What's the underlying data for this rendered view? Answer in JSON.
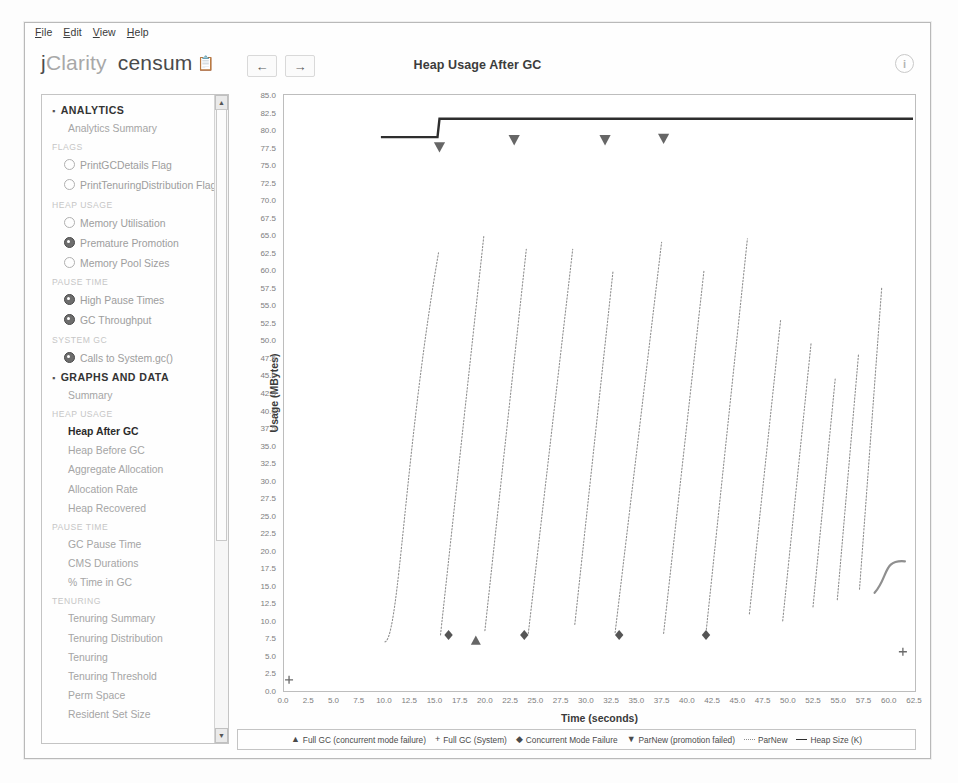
{
  "window": {
    "menubar": [
      {
        "label": "File",
        "mnemonic": "F"
      },
      {
        "label": "Edit",
        "mnemonic": "E"
      },
      {
        "label": "View",
        "mnemonic": "V"
      },
      {
        "label": "Help",
        "mnemonic": "H"
      }
    ]
  },
  "brand": {
    "j": "j",
    "clarity": "Clarity",
    "product": "censum",
    "trademark_icon": "clipboard-icon"
  },
  "toolbar": {
    "back_label": "←",
    "forward_label": "→",
    "title": "Heap Usage After GC",
    "help_label": "i",
    "help_icon": "info-icon"
  },
  "sidebar": {
    "sections": [
      {
        "type": "group",
        "label": "ANALYTICS",
        "rows": [
          {
            "type": "plain",
            "label": "Analytics Summary"
          },
          {
            "type": "subheader",
            "label": "FLAGS"
          },
          {
            "type": "item",
            "label": "PrintGCDetails Flag",
            "icon": "ring-icon",
            "filled": false
          },
          {
            "type": "item",
            "label": "PrintTenuringDistribution Flag",
            "icon": "ring-icon",
            "filled": false
          },
          {
            "type": "subheader",
            "label": "HEAP USAGE"
          },
          {
            "type": "item",
            "label": "Memory Utilisation",
            "icon": "ring-icon",
            "filled": false
          },
          {
            "type": "item",
            "label": "Premature Promotion",
            "icon": "ring-icon",
            "filled": true
          },
          {
            "type": "item",
            "label": "Memory Pool Sizes",
            "icon": "ring-icon",
            "filled": false
          },
          {
            "type": "subheader",
            "label": "PAUSE TIME"
          },
          {
            "type": "item",
            "label": "High Pause Times",
            "icon": "ring-icon",
            "filled": true
          },
          {
            "type": "item",
            "label": "GC Throughput",
            "icon": "ring-icon",
            "filled": true
          },
          {
            "type": "subheader",
            "label": "SYSTEM GC"
          },
          {
            "type": "item",
            "label": "Calls to System.gc()",
            "icon": "ring-icon",
            "filled": true
          }
        ]
      },
      {
        "type": "group",
        "label": "GRAPHS AND DATA",
        "rows": [
          {
            "type": "plain",
            "label": "Summary"
          },
          {
            "type": "subheader",
            "label": "HEAP USAGE"
          },
          {
            "type": "plain",
            "label": "Heap After GC",
            "active": true
          },
          {
            "type": "plain",
            "label": "Heap Before GC"
          },
          {
            "type": "plain",
            "label": "Aggregate Allocation"
          },
          {
            "type": "plain",
            "label": "Allocation Rate"
          },
          {
            "type": "plain",
            "label": "Heap Recovered"
          },
          {
            "type": "subheader",
            "label": "PAUSE TIME"
          },
          {
            "type": "plain",
            "label": "GC Pause Time"
          },
          {
            "type": "plain",
            "label": "CMS Durations"
          },
          {
            "type": "plain",
            "label": "% Time in GC"
          },
          {
            "type": "subheader",
            "label": "TENURING"
          },
          {
            "type": "plain",
            "label": "Tenuring Summary"
          },
          {
            "type": "plain",
            "label": "Tenuring Distribution"
          },
          {
            "type": "plain",
            "label": "Tenuring"
          },
          {
            "type": "plain",
            "label": "Tenuring Threshold"
          },
          {
            "type": "plain",
            "label": "Perm Space"
          },
          {
            "type": "plain",
            "label": "Resident Set Size"
          }
        ]
      }
    ],
    "scrollbar": {
      "up_label": "▲",
      "down_label": "▼"
    }
  },
  "chart_data": {
    "type": "line",
    "title": "Heap Usage After GC",
    "xlabel": "Time (seconds)",
    "ylabel": "Usage (MBytes)",
    "xlim": [
      0.0,
      62.5
    ],
    "ylim": [
      0.0,
      85.0
    ],
    "xticks": [
      0.0,
      2.5,
      5.0,
      7.5,
      10.0,
      12.5,
      15.0,
      17.5,
      20.0,
      22.5,
      25.0,
      27.5,
      30.0,
      32.5,
      35.0,
      37.5,
      40.0,
      42.5,
      45.0,
      47.5,
      50.0,
      52.5,
      55.0,
      57.5,
      60.0,
      62.5
    ],
    "yticks": [
      0.0,
      2.5,
      5.0,
      7.5,
      10.0,
      12.5,
      15.0,
      17.5,
      20.0,
      22.5,
      25.0,
      27.5,
      30.0,
      32.5,
      35.0,
      37.5,
      40.0,
      42.5,
      45.0,
      47.5,
      50.0,
      52.5,
      55.0,
      57.5,
      60.0,
      62.5,
      65.0,
      67.5,
      70.0,
      72.5,
      75.0,
      77.5,
      80.0,
      82.5,
      85.0
    ],
    "grid": false,
    "legend_position": "bottom",
    "series": [
      {
        "name": "Heap Size (K)",
        "style": "solid-step",
        "color": "#2e2e2e",
        "points": [
          [
            9.6,
            79.0
          ],
          [
            15.2,
            79.0
          ],
          [
            15.4,
            81.6
          ],
          [
            62.3,
            81.6
          ]
        ]
      },
      {
        "name": "ParNew",
        "style": "dotted-sawtooth",
        "color": "#8f8f8f",
        "sawteeth": [
          {
            "x_start": 10.0,
            "y_start": 7.0,
            "x_end": 15.3,
            "y_end": 62.5,
            "curve": true
          },
          {
            "x_start": 15.5,
            "y_start": 8.0,
            "x_end": 19.8,
            "y_end": 65.0
          },
          {
            "x_start": 19.9,
            "y_start": 8.6,
            "x_end": 24.0,
            "y_end": 63.0
          },
          {
            "x_start": 24.2,
            "y_start": 8.2,
            "x_end": 28.6,
            "y_end": 63.0
          },
          {
            "x_start": 28.8,
            "y_start": 9.5,
            "x_end": 32.6,
            "y_end": 60.0
          },
          {
            "x_start": 32.8,
            "y_start": 8.3,
            "x_end": 37.4,
            "y_end": 64.0
          },
          {
            "x_start": 37.6,
            "y_start": 8.2,
            "x_end": 41.6,
            "y_end": 60.0
          },
          {
            "x_start": 41.8,
            "y_start": 8.3,
            "x_end": 45.9,
            "y_end": 64.5
          },
          {
            "x_start": 46.1,
            "y_start": 11.0,
            "x_end": 49.2,
            "y_end": 53.0
          },
          {
            "x_start": 49.4,
            "y_start": 10.0,
            "x_end": 52.2,
            "y_end": 49.5
          },
          {
            "x_start": 52.4,
            "y_start": 12.0,
            "x_end": 54.6,
            "y_end": 44.5
          },
          {
            "x_start": 54.8,
            "y_start": 13.0,
            "x_end": 56.9,
            "y_end": 48.0
          },
          {
            "x_start": 57.0,
            "y_start": 14.5,
            "x_end": 59.2,
            "y_end": 57.5
          },
          {
            "x_start": 58.5,
            "y_start": 14.0,
            "x_end": 61.5,
            "y_end": 18.5,
            "tail": true
          }
        ]
      }
    ],
    "markers": {
      "concurrent_mode_failure": {
        "glyph": "◆",
        "points": [
          [
            16.3,
            8.0
          ],
          [
            23.8,
            8.0
          ],
          [
            33.2,
            8.0
          ],
          [
            41.8,
            8.0
          ]
        ]
      },
      "full_gc_concurrent_mode_failure": {
        "glyph": "▲",
        "points": [
          [
            19.0,
            7.2
          ]
        ]
      },
      "parnew_promotion_failed": {
        "glyph": "▼",
        "points": [
          [
            15.4,
            77.6
          ],
          [
            22.8,
            78.6
          ],
          [
            31.8,
            78.6
          ],
          [
            37.6,
            78.8
          ]
        ]
      },
      "full_gc_system": {
        "glyph": "+",
        "points": [
          [
            0.5,
            1.6
          ],
          [
            61.3,
            5.6
          ]
        ]
      }
    },
    "legend": [
      {
        "glyph": "▲",
        "label": "Full GC (concurrent mode failure)",
        "kind": "glyph"
      },
      {
        "glyph": "+",
        "label": "Full GC (System)",
        "kind": "glyph"
      },
      {
        "glyph": "◆",
        "label": "Concurrent Mode Failure",
        "kind": "glyph"
      },
      {
        "glyph": "▼",
        "label": "ParNew (promotion failed)",
        "kind": "glyph"
      },
      {
        "glyph": "",
        "label": "ParNew",
        "kind": "dash"
      },
      {
        "glyph": "",
        "label": "Heap Size (K)",
        "kind": "solid"
      }
    ]
  }
}
